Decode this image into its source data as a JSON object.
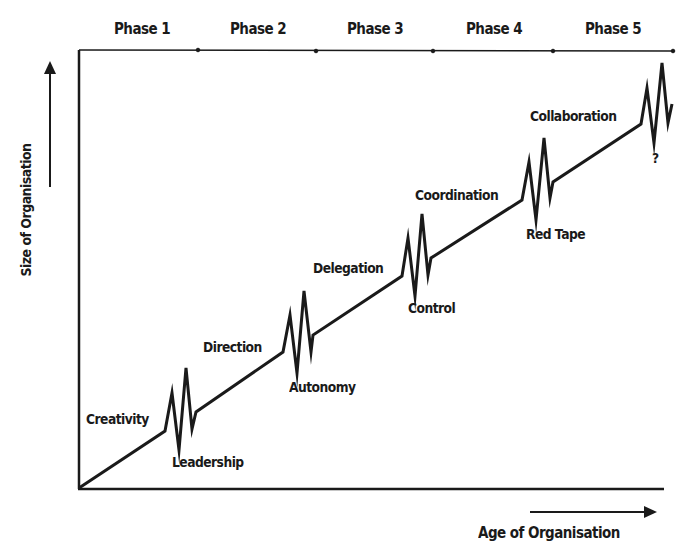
{
  "diagram": {
    "phases": [
      "Phase 1",
      "Phase 2",
      "Phase 3",
      "Phase 4",
      "Phase 5"
    ],
    "axes": {
      "y_label": "Size of Organisation",
      "x_label": "Age of Organisation"
    },
    "evolution_stages": [
      "Creativity",
      "Direction",
      "Delegation",
      "Coordination",
      "Collaboration"
    ],
    "crises": [
      "Leadership",
      "Autonomy",
      "Control",
      "Red Tape",
      "?"
    ],
    "colors": {
      "ink": "#1a1a1a",
      "background": "#ffffff"
    }
  }
}
